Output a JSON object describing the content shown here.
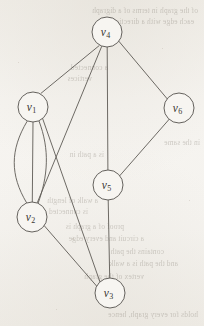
{
  "figure": {
    "type": "undirected-multigraph",
    "caption": "",
    "background_color": "#f4f2ee",
    "stroke_color": "#5d5a55",
    "node_fill_color": "#f7f5f1",
    "node_radius": 15,
    "canvas": {
      "width": 204,
      "height": 326
    }
  },
  "graph_data": {
    "type": "graph",
    "directed": false,
    "multigraph": true,
    "node_count": 6,
    "edge_count": 11,
    "nodes": [
      {
        "id": "v1",
        "label_base": "v",
        "label_sub": "1",
        "x": 33,
        "y": 107,
        "degree": 5
      },
      {
        "id": "v2",
        "label_base": "v",
        "label_sub": "2",
        "x": 32,
        "y": 217,
        "degree": 5
      },
      {
        "id": "v3",
        "label_base": "v",
        "label_sub": "3",
        "x": 110,
        "y": 293,
        "degree": 3
      },
      {
        "id": "v4",
        "label_base": "v",
        "label_sub": "4",
        "x": 107,
        "y": 32,
        "degree": 4
      },
      {
        "id": "v5",
        "label_base": "v",
        "label_sub": "5",
        "x": 108,
        "y": 185,
        "degree": 3
      },
      {
        "id": "v6",
        "label_base": "v",
        "label_sub": "6",
        "x": 179,
        "y": 108,
        "degree": 2
      }
    ],
    "edges": [
      {
        "id": "e1",
        "source": "v4",
        "target": "v1",
        "shape": "straight"
      },
      {
        "id": "e2",
        "source": "v4",
        "target": "v2",
        "shape": "straight"
      },
      {
        "id": "e3",
        "source": "v4",
        "target": "v5",
        "shape": "straight"
      },
      {
        "id": "e4",
        "source": "v4",
        "target": "v6",
        "shape": "straight"
      },
      {
        "id": "e5",
        "source": "v6",
        "target": "v5",
        "shape": "straight"
      },
      {
        "id": "e6",
        "source": "v5",
        "target": "v3",
        "shape": "straight"
      },
      {
        "id": "e7",
        "source": "v1",
        "target": "v2",
        "shape": "curve-left",
        "parallel_index": 1
      },
      {
        "id": "e8",
        "source": "v1",
        "target": "v2",
        "shape": "straight",
        "parallel_index": 2
      },
      {
        "id": "e9",
        "source": "v1",
        "target": "v2",
        "shape": "curve-right",
        "parallel_index": 3
      },
      {
        "id": "e10",
        "source": "v1",
        "target": "v3",
        "shape": "straight"
      },
      {
        "id": "e11",
        "source": "v2",
        "target": "v3",
        "shape": "straight"
      }
    ],
    "edge_paths": [
      {
        "id": "e1",
        "d": "M 99.1 45.7 L 41.0 93.3"
      },
      {
        "id": "e2",
        "d": "M 101.6 46.6 L 37.4 202.4"
      },
      {
        "id": "e3",
        "d": "M 107.2 47.0 L 107.9 170.0"
      },
      {
        "id": "e4",
        "d": "M 119.0 41.4 L 167.1 98.7"
      },
      {
        "id": "e5",
        "d": "M 169.4 119.0 L 119.5 176.0"
      },
      {
        "id": "e6",
        "d": "M 108.2 200.0 L 109.7 278.0"
      },
      {
        "id": "e7",
        "d": "M 27.0 121.5 C 10.0 150.0 10.0 175.0 26.5 202.6"
      },
      {
        "id": "e8",
        "d": "M 33.0 122.0 L 32.3 202.0"
      },
      {
        "id": "e9",
        "d": "M 39.0 121.0 C 50.0 150.0 48.0 176.0 38.0 203.5"
      },
      {
        "id": "e10",
        "d": "M 42.5 118.2 L 100.0 282.0"
      },
      {
        "id": "e11",
        "d": "M 44.0 225.4 L 97.0 286.5"
      }
    ],
    "parallel_edge_groups": [
      {
        "between": [
          "v1",
          "v2"
        ],
        "multiplicity": 3
      }
    ]
  },
  "bleed_through_text": {
    "description": "faint mirrored show-through text from reverse side of scanned page",
    "lines": [
      {
        "text": "of the graph in terms of a digraph",
        "x": 6,
        "y": 6,
        "size": 7.4
      },
      {
        "text": "each edge with a direction",
        "x": 10,
        "y": 17,
        "size": 7.4
      },
      {
        "text": "a connected",
        "x": 96,
        "y": 63,
        "size": 7.4
      },
      {
        "text": "vertices",
        "x": 112,
        "y": 74,
        "size": 7.4
      },
      {
        "text": "in the same",
        "x": 4,
        "y": 138,
        "size": 7.4
      },
      {
        "text": "is a path in",
        "x": 100,
        "y": 150,
        "size": 7.4
      },
      {
        "text": "a walk of length",
        "x": 106,
        "y": 196,
        "size": 7.4
      },
      {
        "text": "is connected",
        "x": 116,
        "y": 207,
        "size": 7.4
      },
      {
        "text": "proof of a graph is",
        "x": 80,
        "y": 222,
        "size": 7.4
      },
      {
        "text": "a circuit and every edge",
        "x": 60,
        "y": 234,
        "size": 7.4
      },
      {
        "text": "contains the path",
        "x": 40,
        "y": 247,
        "size": 7.4
      },
      {
        "text": "and the path is a walk",
        "x": 26,
        "y": 259,
        "size": 7.4
      },
      {
        "text": "vertex of the graph",
        "x": 60,
        "y": 272,
        "size": 7.4
      },
      {
        "text": "holds for every graph, hence",
        "x": 6,
        "y": 310,
        "size": 7.4
      }
    ]
  }
}
